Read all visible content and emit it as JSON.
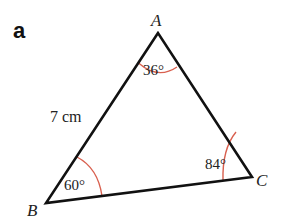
{
  "part_label": "a",
  "triangle": {
    "vertices": [
      {
        "name": "A",
        "label": "A"
      },
      {
        "name": "B",
        "label": "B"
      },
      {
        "name": "C",
        "label": "C"
      }
    ],
    "angles": {
      "A": "36°",
      "B": "60°",
      "C": "84°"
    },
    "side_AB": "7 cm"
  },
  "colors": {
    "edge": "#111111",
    "angle_arc": "#d9604f",
    "text": "#222222"
  }
}
